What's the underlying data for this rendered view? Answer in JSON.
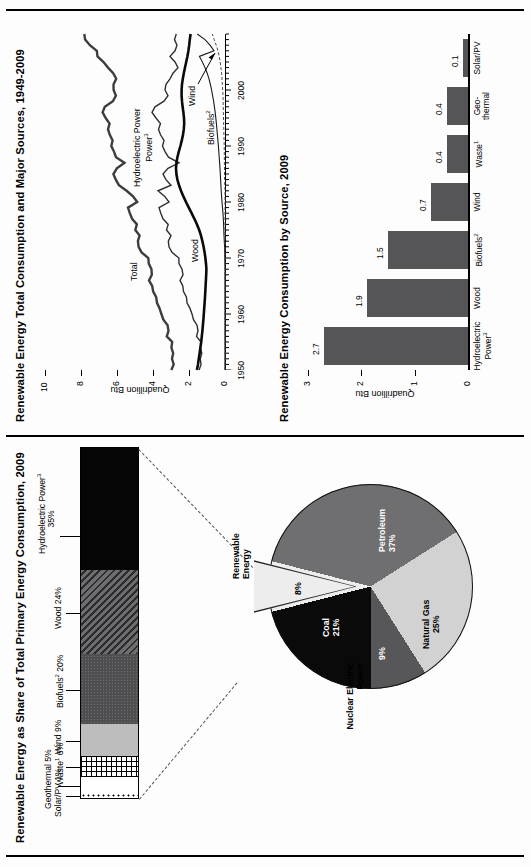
{
  "page": {
    "background": "#fdfdfd",
    "orientation": "rotated-90-ccw"
  },
  "left_panel": {
    "title": "Renewable Energy as Share of Total Primary Energy Consumption, 2009",
    "pie": {
      "type": "pie",
      "title": "",
      "slices": [
        {
          "label": "Petroleum",
          "value_label": "37%",
          "value": 37,
          "color": "#6f6f71",
          "text_color": "#ffffff"
        },
        {
          "label": "Natural Gas",
          "value_label": "25%",
          "value": 25,
          "color": "#d2d2d2",
          "text_color": "#000000"
        },
        {
          "label": "Nuclear Electric Power",
          "value_label": "9%",
          "value": 9,
          "color": "#575759",
          "text_color": "#ffffff"
        },
        {
          "label": "Coal",
          "value_label": "21%",
          "value": 21,
          "color": "#0a0a0a",
          "text_color": "#ffffff"
        },
        {
          "label": "Renewable Energy",
          "value_label": "8%",
          "value": 8,
          "color": "#ededed",
          "text_color": "#000000"
        }
      ]
    },
    "stacked_bar": {
      "type": "bar",
      "note": "Breakdown of the 8% Renewable Energy wedge",
      "segments": [
        {
          "label": "Solar/PV",
          "value_label": "1%",
          "value": 1,
          "fill": "dots-open"
        },
        {
          "label": "Geothermal",
          "value_label": "5%",
          "value": 5,
          "fill": "white"
        },
        {
          "label": "Waste",
          "sup": "1",
          "value_label": "6%",
          "value": 6,
          "fill": "grid"
        },
        {
          "label": "Wind",
          "value_label": "9%",
          "value": 9,
          "fill": "light-gray"
        },
        {
          "label": "Biofuels",
          "sup": "2",
          "value_label": "20%",
          "value": 20,
          "fill": "dark-stipple"
        },
        {
          "label": "Wood",
          "value_label": "24%",
          "value": 24,
          "fill": "diagonal-hatch"
        },
        {
          "label": "Hydroelectric Power",
          "sup": "3",
          "value_label": "35%",
          "value": 35,
          "fill": "black"
        }
      ]
    }
  },
  "right_panel": {
    "line_chart": {
      "type": "line",
      "title": "Renewable Energy Total Consumption and Major Sources, 1949-2009",
      "ylabel": "Quadrillion Btu",
      "xlabel": "",
      "ylim": [
        0,
        10
      ],
      "yticks": [
        "0",
        "2",
        "4",
        "6",
        "8",
        "10"
      ],
      "xlim": [
        1949,
        2009
      ],
      "xticks": [
        "1950",
        "1960",
        "1970",
        "1980",
        "1990",
        "2000"
      ],
      "series": [
        {
          "name": "Total",
          "x": [
            1949,
            1952,
            1955,
            1958,
            1961,
            1964,
            1967,
            1970,
            1973,
            1976,
            1979,
            1982,
            1985,
            1988,
            1991,
            1994,
            1997,
            2000,
            2003,
            2006,
            2009
          ],
          "values": [
            2.97,
            2.85,
            2.88,
            3.17,
            3.4,
            3.65,
            4.06,
            4.07,
            4.43,
            4.74,
            5.17,
            6.04,
            6.21,
            5.65,
            6.16,
            6.26,
            6.66,
            6.26,
            6.15,
            6.8,
            7.74
          ]
        },
        {
          "name": "Hydroelectric Power",
          "sup": "3",
          "x": [
            1949,
            1955,
            1961,
            1967,
            1973,
            1979,
            1985,
            1991,
            1997,
            2003,
            2009
          ],
          "values": [
            1.43,
            1.36,
            1.61,
            2.12,
            2.86,
            2.93,
            2.97,
            3.02,
            3.64,
            2.83,
            2.69
          ]
        },
        {
          "name": "Wood",
          "x": [
            1949,
            1955,
            1961,
            1967,
            1973,
            1979,
            1985,
            1991,
            1997,
            2003,
            2009
          ],
          "values": [
            1.55,
            1.42,
            1.32,
            1.22,
            1.53,
            1.84,
            2.69,
            2.18,
            2.21,
            2.0,
            1.88
          ]
        },
        {
          "name": "Biofuels",
          "sup": "2",
          "x": [
            1949,
            1970,
            1981,
            1990,
            2000,
            2005,
            2009
          ],
          "values": [
            0.0,
            0.0,
            0.06,
            0.11,
            0.23,
            0.4,
            1.54
          ]
        },
        {
          "name": "Wind",
          "x": [
            1949,
            1983,
            1995,
            2005,
            2009
          ],
          "values": [
            0.0,
            0.0,
            0.03,
            0.18,
            0.7
          ]
        }
      ],
      "annotations": [
        {
          "text": "Total"
        },
        {
          "text": "Hydroelectric Power",
          "sup": "3"
        },
        {
          "text": "Wood"
        },
        {
          "text": "Biofuels",
          "sup": "2"
        },
        {
          "text": "Wind"
        }
      ]
    },
    "bar_chart": {
      "type": "bar",
      "title": "Renewable Energy Consumption by Source, 2009",
      "ylabel": "Quadrillion Btu",
      "ylim": [
        0,
        3
      ],
      "yticks": [
        "0",
        "1",
        "2",
        "3"
      ],
      "categories": [
        "Hydroelectric Power",
        "Wood",
        "Biofuels",
        "Wind",
        "Waste",
        "Geo-thermal",
        "Solar/PV"
      ],
      "category_sups": [
        "3",
        "",
        "2",
        "",
        "1",
        "",
        ""
      ],
      "values": [
        2.7,
        1.9,
        1.5,
        0.7,
        0.4,
        0.4,
        0.1
      ],
      "value_labels": [
        "2.7",
        "1.9",
        "1.5",
        "0.7",
        "0.4",
        "0.4",
        "0.1"
      ],
      "bar_color": "#555557"
    }
  }
}
